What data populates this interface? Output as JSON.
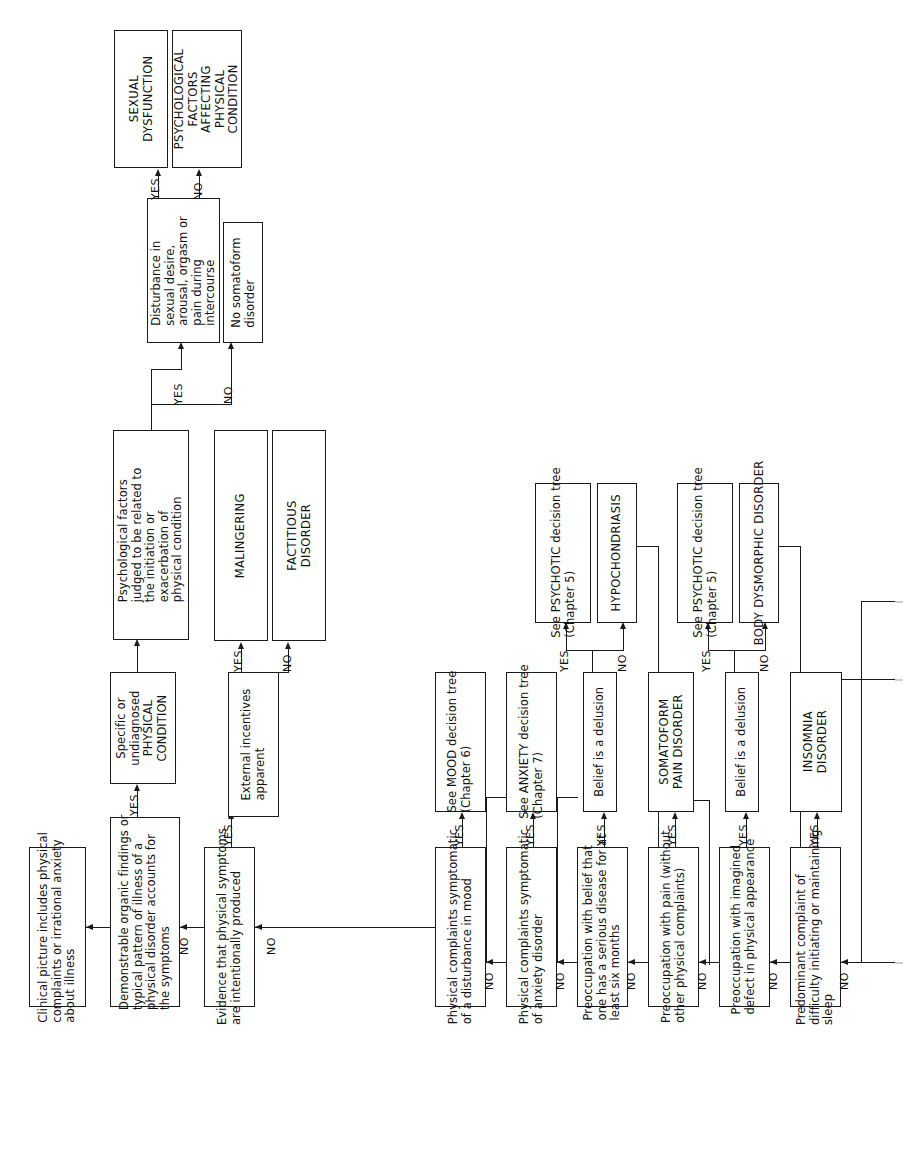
{
  "diagram": {
    "orientation": "rotated-90-ccw",
    "edge_labels": {
      "yes": "YES",
      "no": "NO"
    },
    "nodes": {
      "start": "Clinical picture includes physical\ncomplaints or irrational anxiety\nabout illness",
      "organic": "Demonstrable organic findings or\ntypical pattern of illness of a\nphysical disorder accounts for\nthe symptoms",
      "specific_physical": "Specific or\nundiagnosed\nPHYSICAL\nCONDITION",
      "psych_factors": "Psychological factors\njudged to be related to\nthe initiation or\nexacerbation of\nphysical condition",
      "sexual_disturbance": "Disturbance in\nsexual desire,\narousal, orgasm or\npain during\nintercourse",
      "sexual_dysfunction": "SEXUAL\nDYSFUNCTION",
      "psych_factors_affecting": "PSYCHOLOGICAL\nFACTORS\nAFFECTING\nPHYSICAL\nCONDITION",
      "no_somatoform": "No somatoform\ndisorder",
      "intentional": "Evidence that physical symptoms\nare intentionally produced",
      "external_incentives": "External incentives\napparent",
      "malingering": "MALINGERING",
      "factitious": "FACTITIOUS\nDISORDER",
      "mood_symptomatic": "Physical complaints symptomatic\nof a disturbance in mood",
      "mood_tree": "See MOOD decision tree\n(Chapter 6)",
      "anxiety_symptomatic": "Physical complaints symptomatic\nof anxiety disorder",
      "anxiety_tree": "See ANXIETY decision tree\n(Chapter 7)",
      "serious_disease": "Preoccupation with belief that\none has a serious disease for at\nleast six months",
      "delusion_1": "Belief is a delusion",
      "psychotic_tree_1": "See PSYCHOTIC decision tree\n(Chapter 5)",
      "hypochondriasis": "HYPOCHONDRIASIS",
      "pain_preoccupation": "Preoccupation with pain (without\nother physical complaints)",
      "somatoform_pain": "SOMATOFORM\nPAIN DISORDER",
      "appearance_preoccupation": "Preoccupation with imagined\ndefect in physical appearance",
      "delusion_2": "Belief is a delusion",
      "psychotic_tree_2": "See PSYCHOTIC decision tree\n(Chapter 5)",
      "body_dysmorphic": "BODY DYSMORPHIC DISORDER",
      "insomnia_complaint": "Predominant complaint of\ndifficulty initiating or maintaining\nsleep",
      "insomnia_disorder": "INSOMNIA\nDISORDER"
    }
  }
}
